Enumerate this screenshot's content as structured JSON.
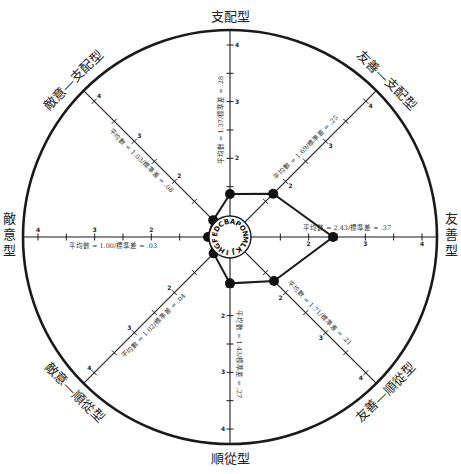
{
  "diagram": {
    "center_letters": [
      "A",
      "B",
      "C",
      "D",
      "E",
      "F",
      "G",
      "H",
      "I",
      "J",
      "K",
      "L",
      "M",
      "N",
      "O",
      "P"
    ],
    "scale": {
      "min": 1,
      "max": 4,
      "ticks": [
        1,
        2,
        3,
        4
      ]
    },
    "axes": [
      {
        "id": "dominant",
        "label": "支配型",
        "angle_deg": -90,
        "mean": 1.37,
        "sd": 0.28,
        "stat_text": "平均數 = 1.37/標準差 = .28"
      },
      {
        "id": "friendly-dominant",
        "label": "友善—支配型",
        "angle_deg": -45,
        "mean": 1.69,
        "sd": 0.25,
        "stat_text": "平均數 = 1.69/標準差 = .25"
      },
      {
        "id": "friendly",
        "label": "友善型",
        "angle_deg": 0,
        "mean": 2.43,
        "sd": 0.37,
        "stat_text": "平均數 = 2.43/標準差 = .37"
      },
      {
        "id": "friendly-submissive",
        "label": "友善—順從型",
        "angle_deg": 45,
        "mean": 1.71,
        "sd": 0.21,
        "stat_text": "平均數 = 1.71/標準差 = .21"
      },
      {
        "id": "submissive",
        "label": "順從型",
        "angle_deg": 90,
        "mean": 1.43,
        "sd": 0.27,
        "stat_text": "平均數 = 1.43/標準差 = .27"
      },
      {
        "id": "hostile-submissive",
        "label": "敵意—順從型",
        "angle_deg": 135,
        "mean": 1.02,
        "sd": 0.04,
        "stat_text": "平均數 = 1.02/標準差 = .04"
      },
      {
        "id": "hostile",
        "label": "敵意型",
        "angle_deg": 180,
        "mean": 1.0,
        "sd": 0.03,
        "stat_text": "平均數 = 1.00/標準差 = .03"
      },
      {
        "id": "hostile-dominant",
        "label": "敵意—支配型",
        "angle_deg": -135,
        "mean": 1.03,
        "sd": 0.08,
        "stat_text": "平均數 = 1.03/標準差 = .08"
      }
    ],
    "colors": {
      "line": "#1a1a1a",
      "background": "#ffffff",
      "node": "#111111"
    }
  }
}
